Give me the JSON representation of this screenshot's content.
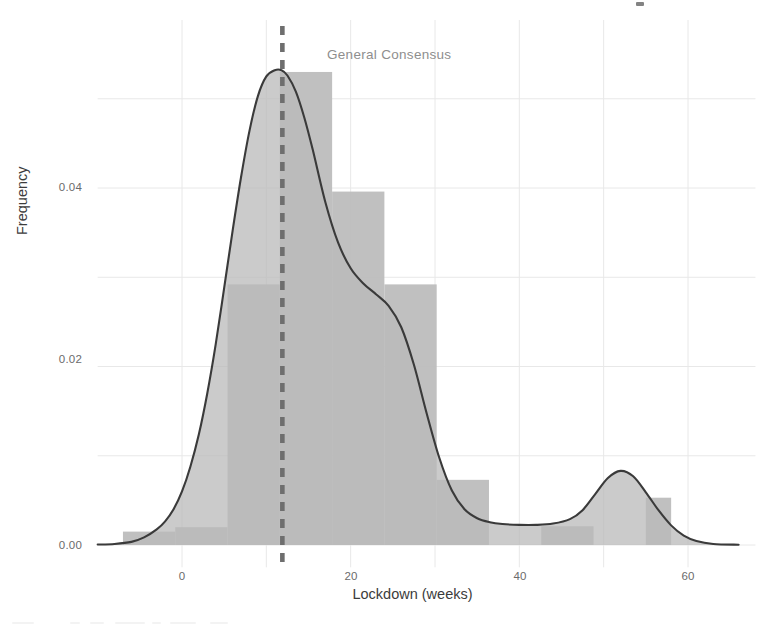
{
  "chart_data": {
    "type": "histogram",
    "title": "",
    "xlabel": "Lockdown (weeks)",
    "ylabel": "Frequency",
    "xlim": [
      -10,
      68
    ],
    "ylim": [
      -0.0025,
      0.0565
    ],
    "xticks": [
      0,
      20,
      40,
      60
    ],
    "xtick_labels": [
      "0",
      "20",
      "40",
      "60"
    ],
    "yticks": [
      0.0,
      0.02,
      0.04
    ],
    "ytick_labels": [
      "0.00",
      "0.02",
      "0.04"
    ],
    "minor_xgrid": [
      10,
      30,
      50
    ],
    "minor_ygrid": [
      0.01,
      0.03,
      0.05
    ],
    "grid": true,
    "legend": "none",
    "bin_edges": [
      -7.0,
      -0.8,
      5.4,
      11.6,
      17.8,
      24.0,
      30.2,
      36.4,
      42.6,
      48.8,
      55.0,
      58.0
    ],
    "bins": [
      {
        "start": -7.0,
        "end": -0.8,
        "height": 0.0015
      },
      {
        "start": -0.8,
        "end": 5.4,
        "height": 0.002
      },
      {
        "start": 5.4,
        "end": 11.6,
        "height": 0.0292
      },
      {
        "start": 11.6,
        "end": 17.8,
        "height": 0.053
      },
      {
        "start": 17.8,
        "end": 24.0,
        "height": 0.0396
      },
      {
        "start": 24.0,
        "end": 30.2,
        "height": 0.0292
      },
      {
        "start": 30.2,
        "end": 36.4,
        "height": 0.0073
      },
      {
        "start": 36.4,
        "end": 42.6,
        "height": 0.0
      },
      {
        "start": 42.6,
        "end": 48.8,
        "height": 0.0021
      },
      {
        "start": 48.8,
        "end": 55.0,
        "height": 0.0
      },
      {
        "start": 55.0,
        "end": 58.0,
        "height": 0.0053
      }
    ],
    "kde_curve": {
      "label": "kernel density estimate",
      "x": [
        -10.0,
        -8.0,
        -6.0,
        -4.5,
        -3.0,
        -2.0,
        -1.0,
        0.0,
        1.0,
        2.0,
        3.0,
        4.0,
        5.0,
        6.0,
        7.0,
        8.0,
        9.0,
        10.0,
        11.0,
        11.8,
        12.5,
        13.5,
        14.5,
        15.5,
        17.0,
        18.5,
        20.0,
        21.5,
        23.0,
        24.5,
        26.0,
        27.5,
        29.0,
        30.5,
        32.0,
        33.5,
        35.0,
        36.5,
        38.0,
        40.0,
        42.0,
        44.0,
        46.0,
        47.5,
        49.0,
        50.5,
        52.0,
        53.5,
        55.0,
        56.5,
        58.0,
        59.5,
        61.0,
        63.0,
        66.0
      ],
      "y": [
        5e-05,
        0.00012,
        0.00035,
        0.00085,
        0.00175,
        0.00265,
        0.004,
        0.006,
        0.0088,
        0.0124,
        0.017,
        0.0225,
        0.0288,
        0.0352,
        0.0412,
        0.0464,
        0.0503,
        0.0525,
        0.0532,
        0.0532,
        0.0526,
        0.0508,
        0.0479,
        0.0443,
        0.0384,
        0.0339,
        0.031,
        0.0293,
        0.0281,
        0.0268,
        0.0244,
        0.0202,
        0.0148,
        0.0098,
        0.0061,
        0.004,
        0.003,
        0.00255,
        0.00235,
        0.00225,
        0.00225,
        0.0024,
        0.0029,
        0.0039,
        0.0057,
        0.0075,
        0.0083,
        0.0077,
        0.0059,
        0.0039,
        0.0022,
        0.00105,
        0.00045,
        0.00012,
        3e-05
      ]
    },
    "vline": {
      "value": 11.9,
      "label": "General Consensus",
      "style": "dashed",
      "color": "#6e6e6e"
    },
    "colors": {
      "bar_fill": "#bdbdbd",
      "kde_line": "#3a3a3a",
      "kde_fill": "#b9b9b9",
      "grid": "#e8e8e8",
      "tick_text": "#6b6b6b",
      "axis_label": "#3c3c3c",
      "annotation_text": "#8e8e8e",
      "background": "#ffffff"
    }
  },
  "axes": {
    "y_tick_labels": [
      {
        "text": "0.04",
        "top": 181
      },
      {
        "text": "0.02",
        "top": 353
      },
      {
        "text": "0.00",
        "top": 539
      }
    ],
    "x_tick_labels": [
      {
        "text": "0",
        "left": 182
      },
      {
        "text": "20",
        "left": 351
      },
      {
        "text": "40",
        "left": 520
      },
      {
        "text": "60",
        "left": 688
      }
    ],
    "xlabel": "Lockdown (weeks)",
    "ylabel": "Frequency"
  },
  "annotation": {
    "text": "General Consensus"
  }
}
